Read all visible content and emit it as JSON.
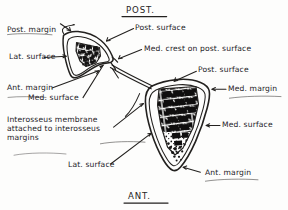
{
  "figure": {
    "type": "anatomical-cross-section-diagram",
    "background_color": "#fdfdfc",
    "ink_color": "#23211f"
  },
  "orientation_headers": {
    "top": "POST.",
    "bottom": "ANT."
  },
  "labels": [
    {
      "id": "post-margin",
      "text": "Post. margin",
      "x": 7,
      "y": 26,
      "size": 7.6
    },
    {
      "id": "post-surface-upper",
      "text": "Post. surface",
      "x": 135,
      "y": 28,
      "size": 7.6
    },
    {
      "id": "med-crest",
      "text": "Med. crest on post. surface",
      "x": 144,
      "y": 50,
      "size": 7.6
    },
    {
      "id": "lat-surface-upper",
      "text": "Lat. surface",
      "x": 9,
      "y": 60,
      "size": 7.6
    },
    {
      "id": "post-surface-lower",
      "text": "Post. surface",
      "x": 198,
      "y": 70,
      "size": 7.6
    },
    {
      "id": "ant-margin-upper",
      "text": "Ant. margin",
      "x": 7,
      "y": 90,
      "size": 7.6
    },
    {
      "id": "med-margin",
      "text": "Med. margin",
      "x": 228,
      "y": 90,
      "size": 7.6
    },
    {
      "id": "med-surface-upper",
      "text": "Med. surface",
      "x": 28,
      "y": 101,
      "size": 7.6
    },
    {
      "id": "med-surface-lower",
      "text": "Med. surface",
      "x": 222,
      "y": 126,
      "size": 7.6
    },
    {
      "id": "lat-surface-lower",
      "text": "Lat. surface",
      "x": 68,
      "y": 166,
      "size": 7.6
    },
    {
      "id": "ant-margin-lower",
      "text": "Ant. margin",
      "x": 202,
      "y": 173,
      "size": 7.6
    }
  ],
  "membrane_note": {
    "id": "interosseus-membrane-note",
    "line1": "Interosseus  membrane",
    "line2": "attached  to  interosseus",
    "line3": "margins",
    "x": 7,
    "y": 118,
    "size": 7.6
  }
}
